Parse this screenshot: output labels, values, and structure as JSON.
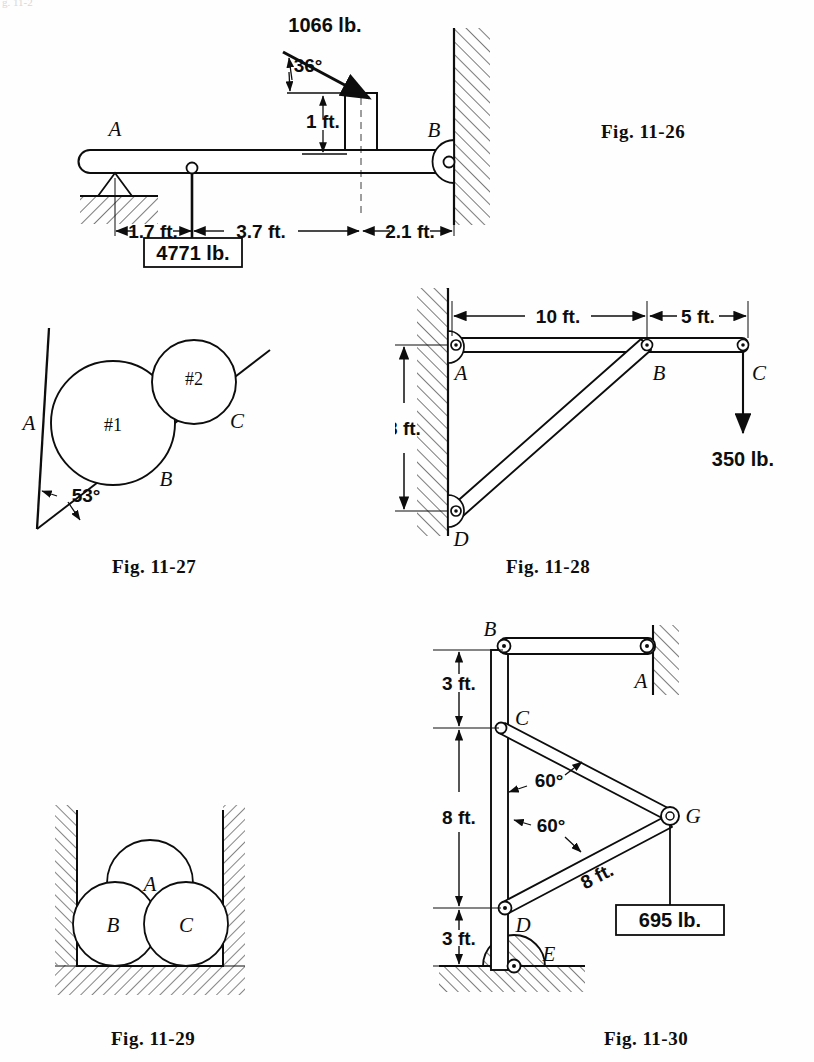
{
  "page": {
    "background": "#fefefe",
    "ink": "#0d0d0d",
    "top_fragment": "g. 11-2"
  },
  "figures": [
    {
      "id": "fig-11-26",
      "caption": "Fig. 11-26",
      "type": "beam-with-inclined-load",
      "points": [
        {
          "label": "A",
          "role": "left-end-knife-support"
        },
        {
          "label": "B",
          "role": "right-end-pin-at-wall"
        }
      ],
      "loads": [
        {
          "label": "1066 lb.",
          "role": "applied-inclined-force",
          "angle": "36°"
        },
        {
          "label": "4771 lb.",
          "role": "hanging-weight-boxed"
        }
      ],
      "angles": [
        {
          "label": "36°"
        }
      ],
      "dimensions": [
        {
          "label": "1 ft.",
          "orientation": "vertical",
          "role": "block-height"
        },
        {
          "label": "1.7 ft.",
          "orientation": "horizontal",
          "role": "A-to-hanger"
        },
        {
          "label": "3.7 ft.",
          "orientation": "horizontal",
          "role": "hanger-to-block-center"
        },
        {
          "label": "2.1 ft.",
          "orientation": "horizontal",
          "role": "block-center-to-wall"
        }
      ]
    },
    {
      "id": "fig-11-27",
      "caption": "Fig. 11-27",
      "type": "two-cylinders-on-incline",
      "points": [
        {
          "label": "A",
          "role": "contact-large-cylinder-vertical-wall"
        },
        {
          "label": "B",
          "role": "contact-large-cylinder-incline"
        },
        {
          "label": "C",
          "role": "contact-small-cylinder-incline"
        }
      ],
      "bodies": [
        {
          "label": "#1",
          "role": "large-cylinder"
        },
        {
          "label": "#2",
          "role": "small-cylinder"
        }
      ],
      "angles": [
        {
          "label": "53°",
          "role": "incline-to-vertical-wall"
        }
      ]
    },
    {
      "id": "fig-11-28",
      "caption": "Fig. 11-28",
      "type": "wall-bracket-truss",
      "points": [
        {
          "label": "A",
          "role": "top-pin-at-wall"
        },
        {
          "label": "B",
          "role": "mid-joint"
        },
        {
          "label": "C",
          "role": "free-end-with-load"
        },
        {
          "label": "D",
          "role": "bottom-pin-at-wall"
        }
      ],
      "loads": [
        {
          "label": "350 lb.",
          "role": "downward-load-at-C"
        }
      ],
      "dimensions": [
        {
          "label": "10 ft.",
          "orientation": "horizontal",
          "role": "A-to-B"
        },
        {
          "label": "5 ft.",
          "orientation": "horizontal",
          "role": "B-to-C"
        },
        {
          "label": "8 ft.",
          "orientation": "vertical",
          "role": "A-to-D"
        }
      ]
    },
    {
      "id": "fig-11-29",
      "caption": "Fig. 11-29",
      "type": "three-cylinders-in-channel",
      "bodies": [
        {
          "label": "A",
          "role": "top-cylinder"
        },
        {
          "label": "B",
          "role": "bottom-left-cylinder"
        },
        {
          "label": "C",
          "role": "bottom-right-cylinder"
        }
      ]
    },
    {
      "id": "fig-11-30",
      "caption": "Fig. 11-30",
      "type": "mast-and-boom-frame",
      "points": [
        {
          "label": "B",
          "role": "mast-top-pin"
        },
        {
          "label": "A",
          "role": "tie-rod-wall-pin"
        },
        {
          "label": "C",
          "role": "upper-boom-pin"
        },
        {
          "label": "D",
          "role": "lower-boom-pin"
        },
        {
          "label": "E",
          "role": "mast-base-pin-on-ground"
        },
        {
          "label": "G",
          "role": "boom-tip-with-load"
        }
      ],
      "loads": [
        {
          "label": "695 lb.",
          "role": "hanging-weight-boxed-at-G"
        }
      ],
      "angles": [
        {
          "label": "60°",
          "role": "angle-at-C"
        },
        {
          "label": "60°",
          "role": "angle-at-D"
        }
      ],
      "dimensions": [
        {
          "label": "3 ft.",
          "orientation": "vertical",
          "role": "B-to-C"
        },
        {
          "label": "8 ft.",
          "orientation": "vertical",
          "role": "C-to-D"
        },
        {
          "label": "3 ft.",
          "orientation": "vertical",
          "role": "D-to-E"
        },
        {
          "label": "8 ft.",
          "orientation": "diagonal",
          "role": "D-to-G-member"
        }
      ]
    }
  ]
}
